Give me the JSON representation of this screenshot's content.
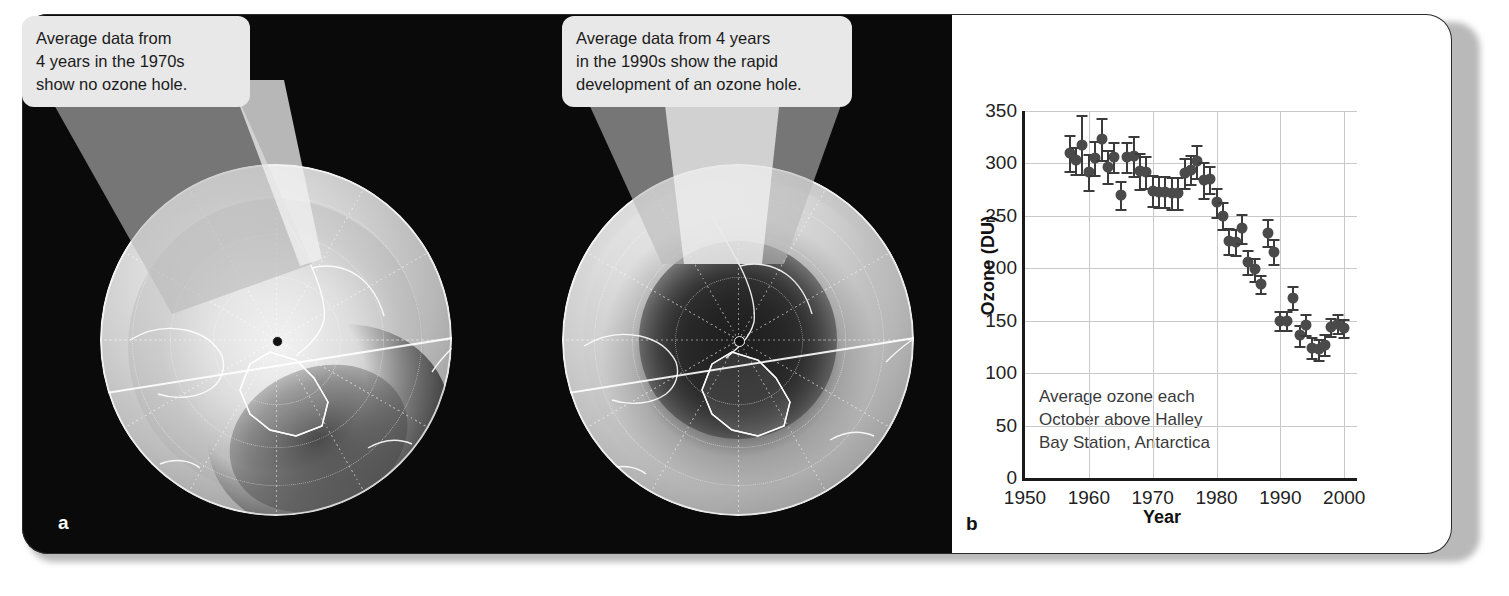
{
  "figure": {
    "panel_a_letter": "a",
    "panel_b_letter": "b"
  },
  "callouts": [
    {
      "id": "callout-1970s",
      "lines": [
        "Average data from",
        "4 years in the 1970s",
        "show no ozone hole."
      ]
    },
    {
      "id": "callout-1990s",
      "lines": [
        "Average data from 4 years",
        "in the 1990s show the rapid",
        "development of an ozone hole."
      ]
    }
  ],
  "globes": [
    {
      "id": "globe-1970s",
      "label": "Antarctic total ozone map, 1970s average, no ozone hole"
    },
    {
      "id": "globe-1990s",
      "label": "Antarctic total ozone map, 1990s average, ozone hole present"
    }
  ],
  "chart_data": {
    "type": "scatter",
    "title": "",
    "xlabel": "Year",
    "ylabel": "Ozone (DU)",
    "xlim": [
      1950,
      2002
    ],
    "ylim": [
      0,
      350
    ],
    "xticks": [
      1950,
      1960,
      1970,
      1980,
      1990,
      2000
    ],
    "yticks": [
      0,
      50,
      100,
      150,
      200,
      250,
      300,
      350
    ],
    "grid": true,
    "legend": null,
    "annotation_lines": [
      "Average ozone each",
      "October above Halley",
      "Bay Station, Antarctica"
    ],
    "errorbars": true,
    "x": [
      1957,
      1958,
      1959,
      1960,
      1961,
      1962,
      1963,
      1964,
      1965,
      1966,
      1967,
      1968,
      1969,
      1970,
      1971,
      1972,
      1973,
      1974,
      1975,
      1976,
      1977,
      1978,
      1979,
      1980,
      1981,
      1982,
      1983,
      1984,
      1985,
      1986,
      1987,
      1988,
      1989,
      1990,
      1991,
      1992,
      1993,
      1994,
      1995,
      1996,
      1997,
      1998,
      1999,
      2000
    ],
    "y": [
      310,
      303,
      318,
      292,
      305,
      323,
      297,
      306,
      270,
      306,
      307,
      293,
      292,
      274,
      273,
      273,
      272,
      272,
      291,
      294,
      302,
      284,
      285,
      263,
      250,
      226,
      225,
      238,
      206,
      199,
      185,
      234,
      216,
      150,
      150,
      172,
      136,
      146,
      124,
      123,
      127,
      144,
      147,
      143
    ],
    "yerr": [
      17,
      13,
      28,
      17,
      16,
      20,
      16,
      14,
      13,
      14,
      19,
      17,
      15,
      15,
      15,
      15,
      15,
      15,
      14,
      14,
      16,
      17,
      13,
      14,
      13,
      12,
      12,
      14,
      11,
      11,
      9,
      13,
      12,
      9,
      9,
      11,
      10,
      10,
      10,
      10,
      10,
      9,
      9,
      9
    ],
    "series_name": "October mean total ozone, Halley Bay"
  }
}
